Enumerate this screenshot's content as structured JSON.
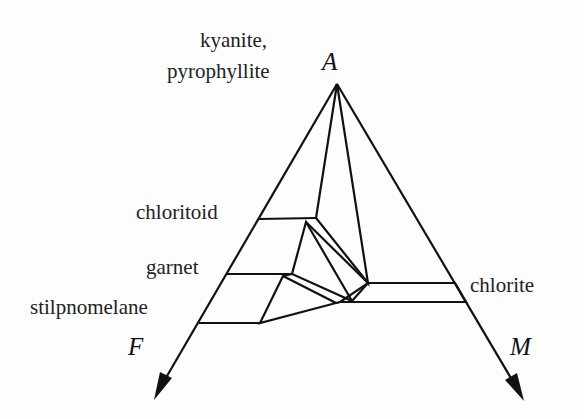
{
  "diagram": {
    "type": "AFM ternary projection",
    "vertices": {
      "top": "A",
      "left": "F",
      "right": "M"
    },
    "labels": {
      "kyanite_line1": "kyanite,",
      "kyanite_line2": "pyrophyllite",
      "chloritoid": "chloritoid",
      "garnet": "garnet",
      "stilpnomelane": "stilpnomelane",
      "chlorite": "chlorite"
    },
    "colors": {
      "line": "#111111",
      "stipple": "#555555",
      "band": "#bdbdbd",
      "background": "#fdfdfd"
    }
  }
}
